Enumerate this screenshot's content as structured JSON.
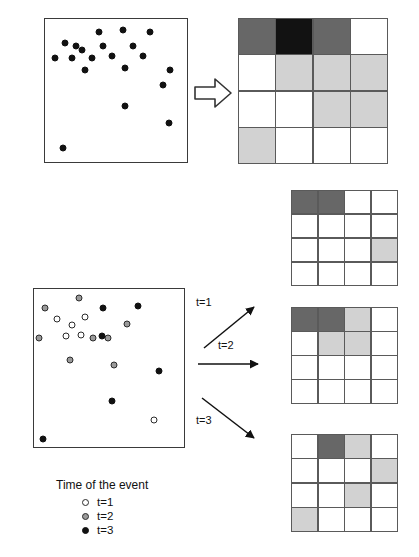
{
  "figure": {
    "type": "diagram"
  },
  "top_row": {
    "scatter": {
      "name": "point-pattern-all-events",
      "marker_type": "t3",
      "points": [
        {
          "x": 22,
          "y": 19
        },
        {
          "x": 38,
          "y": 9
        },
        {
          "x": 14,
          "y": 17
        },
        {
          "x": 55,
          "y": 8
        },
        {
          "x": 41,
          "y": 19
        },
        {
          "x": 26,
          "y": 22
        },
        {
          "x": 7,
          "y": 27
        },
        {
          "x": 19,
          "y": 27
        },
        {
          "x": 33,
          "y": 27
        },
        {
          "x": 47,
          "y": 26
        },
        {
          "x": 62,
          "y": 19
        },
        {
          "x": 74,
          "y": 9
        },
        {
          "x": 69,
          "y": 26
        },
        {
          "x": 28,
          "y": 36
        },
        {
          "x": 56,
          "y": 34
        },
        {
          "x": 88,
          "y": 36
        },
        {
          "x": 83,
          "y": 46
        },
        {
          "x": 56,
          "y": 61
        },
        {
          "x": 87,
          "y": 73
        },
        {
          "x": 13,
          "y": 90
        }
      ]
    },
    "arrow": {
      "name": "transform-arrow",
      "kind": "block-arrow-right"
    },
    "grid": {
      "name": "raster-grid-all-events",
      "rows": 4,
      "cols": 4,
      "cells": [
        [
          2,
          3,
          2,
          0
        ],
        [
          0,
          1,
          1,
          1
        ],
        [
          0,
          0,
          1,
          1
        ],
        [
          1,
          0,
          0,
          0
        ]
      ]
    }
  },
  "bottom_row": {
    "scatter": {
      "name": "point-pattern-timed-events",
      "points": [
        {
          "x": 7,
          "y": 12,
          "t": "t2"
        },
        {
          "x": 30,
          "y": 6,
          "t": "t2"
        },
        {
          "x": 15,
          "y": 19,
          "t": "t1"
        },
        {
          "x": 25,
          "y": 23,
          "t": "t1"
        },
        {
          "x": 34,
          "y": 18,
          "t": "t1"
        },
        {
          "x": 3,
          "y": 31,
          "t": "t2"
        },
        {
          "x": 21,
          "y": 30,
          "t": "t1"
        },
        {
          "x": 31,
          "y": 29,
          "t": "t1"
        },
        {
          "x": 39,
          "y": 31,
          "t": "t2"
        },
        {
          "x": 49,
          "y": 31,
          "t": "t2"
        },
        {
          "x": 24,
          "y": 45,
          "t": "t2"
        },
        {
          "x": 53,
          "y": 48,
          "t": "t2"
        },
        {
          "x": 46,
          "y": 12,
          "t": "t3"
        },
        {
          "x": 69,
          "y": 11,
          "t": "t3"
        },
        {
          "x": 62,
          "y": 22,
          "t": "t2"
        },
        {
          "x": 45,
          "y": 30,
          "t": "t3"
        },
        {
          "x": 83,
          "y": 52,
          "t": "t3"
        },
        {
          "x": 52,
          "y": 71,
          "t": "t3"
        },
        {
          "x": 80,
          "y": 83,
          "t": "t1"
        },
        {
          "x": 6,
          "y": 95,
          "t": "t3"
        }
      ]
    },
    "arrows": [
      {
        "name": "arrow-t1",
        "label": "t=1",
        "direction": "up-right"
      },
      {
        "name": "arrow-t2",
        "label": "t=2",
        "direction": "right"
      },
      {
        "name": "arrow-t3",
        "label": "t=3",
        "direction": "down-right"
      }
    ],
    "grids": [
      {
        "name": "raster-grid-t1",
        "rows": 4,
        "cols": 4,
        "cells": [
          [
            2,
            2,
            0,
            0
          ],
          [
            0,
            0,
            0,
            0
          ],
          [
            0,
            0,
            0,
            1
          ],
          [
            0,
            0,
            0,
            0
          ]
        ]
      },
      {
        "name": "raster-grid-t2",
        "rows": 4,
        "cols": 4,
        "cells": [
          [
            2,
            2,
            1,
            0
          ],
          [
            0,
            1,
            1,
            0
          ],
          [
            0,
            0,
            0,
            0
          ],
          [
            0,
            0,
            0,
            0
          ]
        ]
      },
      {
        "name": "raster-grid-t3",
        "rows": 4,
        "cols": 4,
        "cells": [
          [
            0,
            2,
            1,
            0
          ],
          [
            0,
            0,
            0,
            1
          ],
          [
            0,
            0,
            1,
            0
          ],
          [
            1,
            0,
            0,
            0
          ]
        ]
      }
    ]
  },
  "legend": {
    "title": "Time of the event",
    "items": [
      {
        "marker": "t1",
        "label": "t=1"
      },
      {
        "marker": "t2",
        "label": "t=2"
      },
      {
        "marker": "t3",
        "label": "t=3"
      }
    ]
  },
  "colors": {
    "white": "#ffffff",
    "light_gray": "#d2d2d2",
    "dark_gray": "#676767",
    "black_cell": "#121212",
    "grid_line": "#5a5a5a",
    "box_border": "#3a3a3a"
  }
}
